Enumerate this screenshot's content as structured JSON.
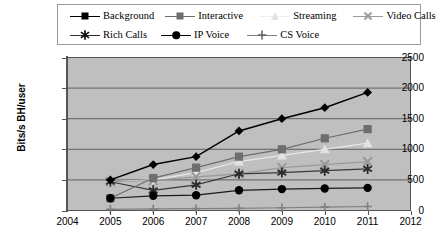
{
  "chart_data": {
    "type": "line",
    "title": "",
    "xlabel": "",
    "ylabel": "Bits/s BH/user",
    "x": [
      2005,
      2006,
      2007,
      2008,
      2009,
      2010,
      2011
    ],
    "xticklabels": [
      "2004",
      "2005",
      "2006",
      "2007",
      "2008",
      "2009",
      "2010",
      "2011",
      "2012"
    ],
    "xlim": [
      2004,
      2012
    ],
    "yticklabels": [
      "0",
      "500",
      "1000",
      "1500",
      "2000",
      "2500"
    ],
    "yticks": [
      0,
      500,
      1000,
      1500,
      2000,
      2500
    ],
    "ylim": [
      0,
      2500
    ],
    "grid": "horizontal",
    "legend_position": "top",
    "plot_background": "#bfbfbf",
    "series": [
      {
        "name": "Background",
        "marker": "diamond",
        "color": "#000000",
        "line_color": "#000000",
        "values": [
          500,
          750,
          880,
          1300,
          1500,
          1680,
          1930
        ]
      },
      {
        "name": "Interactive",
        "marker": "square",
        "color": "#6e6e6e",
        "line_color": "#6e6e6e",
        "values": [
          200,
          530,
          700,
          880,
          1000,
          1180,
          1330
        ]
      },
      {
        "name": "Streaming",
        "marker": "triangle",
        "color": "#e2e2e2",
        "line_color": "#e8e8e8",
        "values": [
          470,
          500,
          620,
          800,
          900,
          1000,
          1100
        ]
      },
      {
        "name": "Video Calls",
        "marker": "cross-x",
        "color": "#9a9a9a",
        "line_color": "#9a9a9a",
        "values": [
          470,
          490,
          550,
          600,
          700,
          750,
          800
        ]
      },
      {
        "name": "Rich Calls",
        "marker": "asterisk",
        "color": "#2b2b2b",
        "line_color": "#3a3a3a",
        "values": [
          470,
          330,
          420,
          600,
          620,
          650,
          680
        ]
      },
      {
        "name": "IP Voice",
        "marker": "circle",
        "color": "#000000",
        "line_color": "#1a1a1a",
        "values": [
          200,
          240,
          250,
          330,
          350,
          360,
          370
        ]
      },
      {
        "name": "CS Voice",
        "marker": "plus",
        "color": "#808080",
        "line_color": "#808080",
        "values": [
          20,
          25,
          30,
          35,
          45,
          55,
          65
        ]
      }
    ]
  },
  "legend": {
    "row1": [
      {
        "label": "Background"
      },
      {
        "label": "Interactive"
      },
      {
        "label": "Streaming"
      },
      {
        "label": "Video Calls"
      }
    ],
    "row2": [
      {
        "label": "Rich Calls"
      },
      {
        "label": "IP Voice"
      },
      {
        "label": "CS Voice"
      }
    ]
  }
}
